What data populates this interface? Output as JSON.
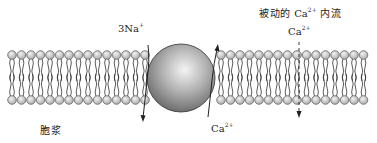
{
  "diagram": {
    "title": "",
    "labels": {
      "na_label": {
        "base": "3Na",
        "sup": "+"
      },
      "ca_out_label": {
        "base": "Ca",
        "sup": "2+"
      },
      "passive_influx_label": {
        "prefix": "被动的 ",
        "ion": "Ca",
        "sup": "2+",
        "suffix": " 内流"
      },
      "ca_channel_label": {
        "base": "Ca",
        "sup": "2+"
      },
      "cytoplasm_label": "胞浆"
    },
    "membrane": {
      "type": "phospholipid-bilayer",
      "head_color": "#c8c8c8",
      "head_stroke": "#555555",
      "top_heads_y": 55,
      "bottom_heads_y": 100,
      "x_start": 12,
      "x_end": 370,
      "head_spacing": 9.5,
      "head_radius": 4.3
    },
    "exchanger": {
      "shape": "sphere",
      "cx": 181,
      "cy": 78,
      "r": 34,
      "color_light": "#f2f2f2",
      "color_dark": "#6e6e6e"
    },
    "arrows": [
      {
        "name": "na-influx-arrow",
        "direction": "down",
        "style": "solid"
      },
      {
        "name": "ca-efflux-arrow",
        "direction": "up",
        "style": "solid"
      },
      {
        "name": "passive-ca-influx-arrow",
        "direction": "down",
        "style": "dashed"
      }
    ]
  }
}
